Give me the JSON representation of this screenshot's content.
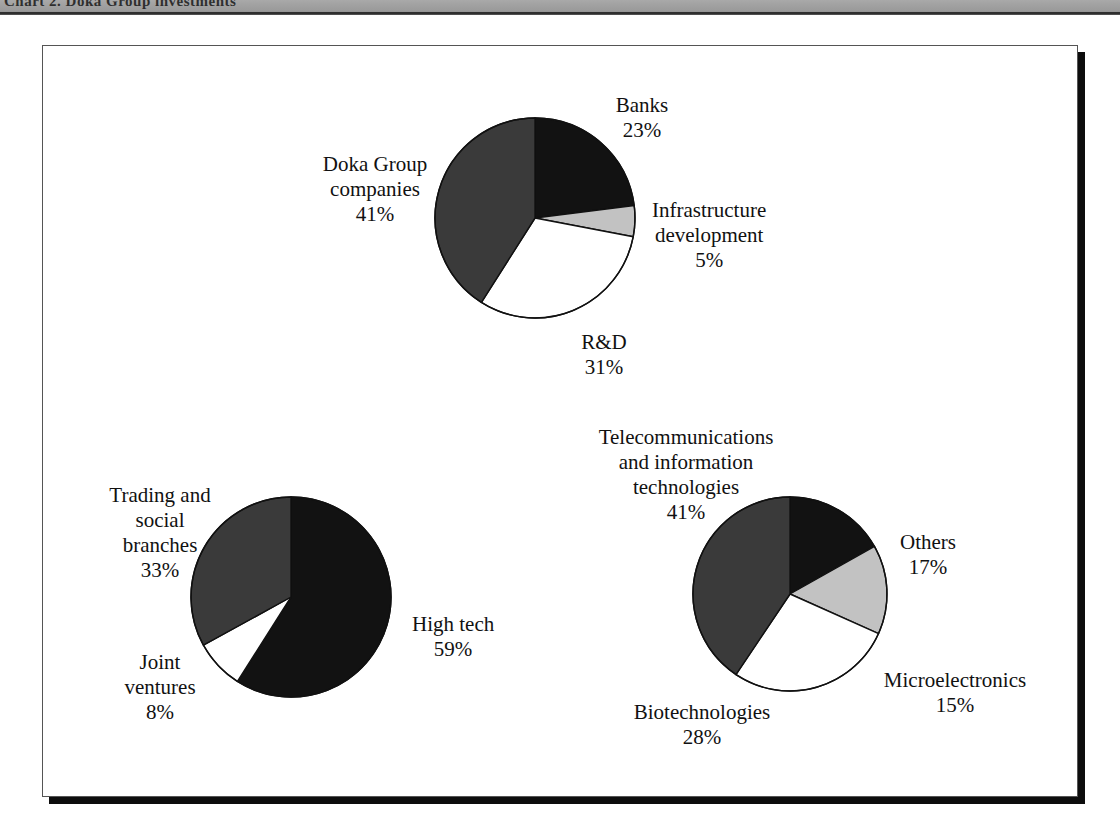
{
  "header": {
    "band_text": "Chart 2.  Doka Group investments",
    "band_visible": true
  },
  "figure": {
    "frame": "bordered-box-with-drop-shadow",
    "background": "#ffffff"
  },
  "palette": {
    "black": "#121212",
    "dark_gray": "#3a3a3a",
    "light_gray": "#c2c2c2",
    "white": "#ffffff",
    "outline": "#111111"
  },
  "chart_data": [
    {
      "type": "pie",
      "id": "chart-investment-sources",
      "title": "",
      "center": {
        "x": 535,
        "y": 218
      },
      "radius": 100,
      "start_angle_deg": 0,
      "direction": "clockwise",
      "categories": [
        "Banks",
        "Infrastructure development",
        "R&D",
        "Doka Group companies"
      ],
      "values": [
        23,
        5,
        31,
        41
      ],
      "value_suffix": "%",
      "colors": [
        "#121212",
        "#c2c2c2",
        "#ffffff",
        "#3a3a3a"
      ],
      "labels": [
        {
          "name": "Banks",
          "value": "23%",
          "x": 642,
          "y": 93,
          "align": "center"
        },
        {
          "name": "Infrastructure\ndevelopment",
          "value": "5%",
          "x": 652,
          "y": 198,
          "align": "left"
        },
        {
          "name": "R&D",
          "value": "31%",
          "x": 604,
          "y": 330,
          "align": "center"
        },
        {
          "name": "Doka Group\ncompanies",
          "value": "41%",
          "x": 375,
          "y": 152,
          "align": "center"
        }
      ]
    },
    {
      "type": "pie",
      "id": "chart-business-structure",
      "title": "",
      "center": {
        "x": 291,
        "y": 597
      },
      "radius": 100,
      "start_angle_deg": 0,
      "direction": "clockwise",
      "categories": [
        "High tech",
        "Joint ventures",
        "Trading and social branches"
      ],
      "values": [
        59,
        8,
        33
      ],
      "value_suffix": "%",
      "colors": [
        "#121212",
        "#ffffff",
        "#3a3a3a"
      ],
      "labels": [
        {
          "name": "High tech",
          "value": "59%",
          "x": 412,
          "y": 612,
          "align": "left"
        },
        {
          "name": "Joint\nventures",
          "value": "8%",
          "x": 160,
          "y": 650,
          "align": "center"
        },
        {
          "name": "Trading and\nsocial\nbranches",
          "value": "33%",
          "x": 160,
          "y": 483,
          "align": "center"
        }
      ]
    },
    {
      "type": "pie",
      "id": "chart-high-tech-breakdown",
      "title": "",
      "center": {
        "x": 790,
        "y": 594
      },
      "radius": 97,
      "start_angle_deg": 0,
      "direction": "clockwise",
      "categories": [
        "Others",
        "Microelectronics",
        "Biotechnologies",
        "Telecommunications and information technologies"
      ],
      "values": [
        17,
        15,
        28,
        41
      ],
      "value_suffix": "%",
      "colors": [
        "#121212",
        "#c2c2c2",
        "#ffffff",
        "#3a3a3a"
      ],
      "labels": [
        {
          "name": "Others",
          "value": "17%",
          "x": 900,
          "y": 530,
          "align": "left"
        },
        {
          "name": "Microelectronics",
          "value": "15%",
          "x": 955,
          "y": 668,
          "align": "center"
        },
        {
          "name": "Biotechnologies",
          "value": "28%",
          "x": 702,
          "y": 700,
          "align": "center"
        },
        {
          "name": "Telecommunications\nand information\ntechnologies",
          "value": "41%",
          "x": 686,
          "y": 425,
          "align": "center"
        }
      ]
    }
  ]
}
